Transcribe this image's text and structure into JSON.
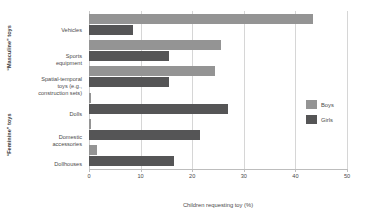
{
  "chart_data": {
    "type": "bar",
    "orientation": "horizontal",
    "title": "",
    "xlabel": "Children requesting toy (%)",
    "ylabel": "",
    "xlim": [
      0,
      50
    ],
    "xticks": [
      0,
      10,
      20,
      30,
      40,
      50
    ],
    "xtick_labels": [
      "0",
      "10",
      "20",
      "30",
      "40",
      "50"
    ],
    "grid": true,
    "grid_axis": "x",
    "legend_position": "right",
    "categories": [
      "Vehicles",
      "Sports\nequipment",
      "Spatial-temporal\ntoys (e.g.,\nconstruction sets)",
      "Dolls",
      "Domestic\naccessories",
      "Dollhouses"
    ],
    "category_groups": [
      {
        "label": "“Masculine” toys",
        "categories": [
          "Vehicles",
          "Sports equipment",
          "Spatial-temporal toys (e.g., construction sets)"
        ]
      },
      {
        "label": "“Feminine” toys",
        "categories": [
          "Dolls",
          "Domestic accessories",
          "Dollhouses"
        ]
      }
    ],
    "series": [
      {
        "name": "Boys",
        "color": "#949494",
        "values": [
          43.5,
          25.5,
          24.5,
          0.3,
          0.3,
          1.5
        ]
      },
      {
        "name": "Girls",
        "color": "#555556",
        "values": [
          8.5,
          15.5,
          15.5,
          27.0,
          21.5,
          16.5
        ]
      }
    ]
  },
  "legend": {
    "items": [
      {
        "label": "Boys",
        "color": "#949494"
      },
      {
        "label": "Girls",
        "color": "#555556"
      }
    ]
  },
  "axis": {
    "x_title": "Children requesting toy (%)",
    "ticks": [
      "0",
      "10",
      "20",
      "30",
      "40",
      "50"
    ]
  },
  "group_labels": {
    "masculine": "“Masculine” toys",
    "feminine": "“Feminine” toys"
  },
  "category_labels": {
    "vehicles": "Vehicles",
    "sports": "Sports\nequipment",
    "spatial": "Spatial-temporal\ntoys (e.g.,\nconstruction sets)",
    "dolls": "Dolls",
    "domestic": "Domestic\naccessories",
    "dollhouses": "Dollhouses"
  }
}
